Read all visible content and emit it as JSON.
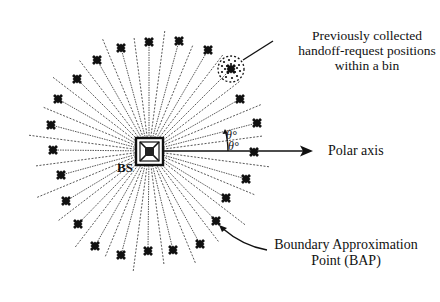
{
  "figure": {
    "bs_label": "BS",
    "theta_upper": "θ°",
    "theta_lower": "θ°",
    "callouts": {
      "bin_points_line1": "Previously collected",
      "bin_points_line2": "handoff-request positions",
      "bin_points_line3": "within a bin",
      "polar_axis": "Polar axis",
      "bap_line1": "Boundary Approximation",
      "bap_line2": "Point (BAP)"
    },
    "geometry": {
      "center": [
        149,
        151
      ],
      "bin_count": 24,
      "bin_width_deg": 15,
      "dashed_line_length": 118,
      "bs_box_size": 27
    },
    "bap_points": [
      [
        254,
        152
      ],
      [
        257,
        123
      ],
      [
        240,
        99
      ],
      [
        231,
        69
      ],
      [
        208,
        50
      ],
      [
        179,
        41
      ],
      [
        149,
        42
      ],
      [
        121,
        48
      ],
      [
        97,
        60
      ],
      [
        77,
        79
      ],
      [
        58,
        99
      ],
      [
        51,
        125
      ],
      [
        53,
        150
      ],
      [
        61,
        175
      ],
      [
        66,
        201
      ],
      [
        78,
        224
      ],
      [
        95,
        246
      ],
      [
        121,
        255
      ],
      [
        148,
        251
      ],
      [
        173,
        250
      ],
      [
        200,
        244
      ],
      [
        216,
        221
      ],
      [
        226,
        198
      ],
      [
        246,
        179
      ]
    ],
    "colors": {
      "ink": "#111111",
      "dash": "#444444",
      "background": "#ffffff"
    }
  }
}
